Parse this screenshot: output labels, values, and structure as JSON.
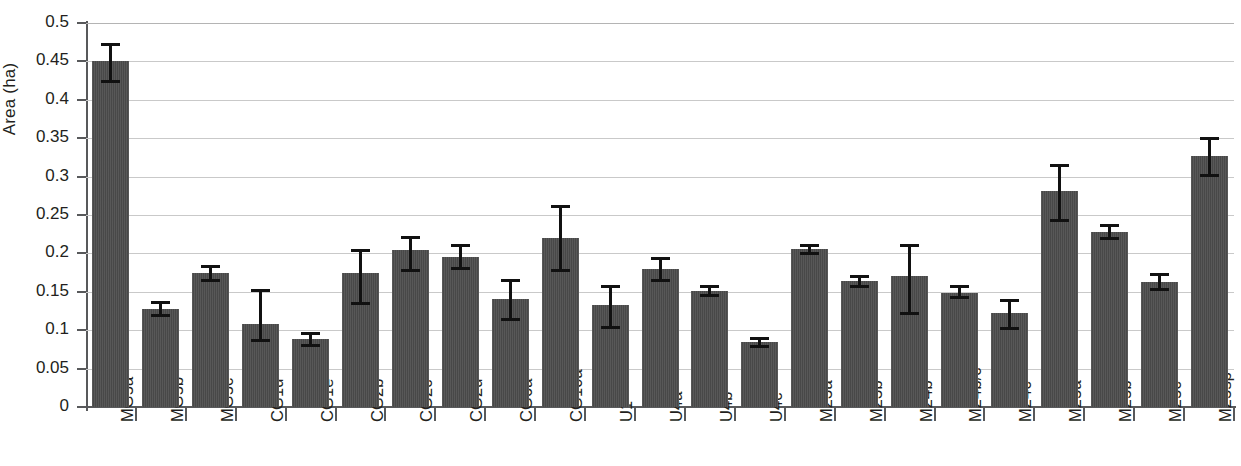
{
  "chart_data": {
    "type": "bar",
    "title": "",
    "xlabel": "",
    "ylabel": "Area (ha)",
    "ylim": [
      0,
      0.5
    ],
    "ytick_labels": [
      "0.5",
      "0.45",
      "0.4",
      "0.35",
      "0.3",
      "0.25",
      "0.2",
      "0.15",
      "0.1",
      "0.05",
      "0"
    ],
    "ytick_values": [
      0.5,
      0.45,
      0.4,
      0.35,
      0.3,
      0.25,
      0.2,
      0.15,
      0.1,
      0.05,
      0
    ],
    "grid": true,
    "legend": null,
    "bar_color": "#4c4c4c",
    "error_bar_color": "#111111",
    "categories": [
      "MG5a",
      "MG5b",
      "MG5c",
      "CG1d",
      "CG1e",
      "CG2b",
      "CG2c",
      "CG2d",
      "CG6a",
      "CG10a",
      "U1",
      "U4a",
      "U4b",
      "U4c",
      "M23a",
      "M23b",
      "M24b",
      "M24b/c",
      "M24c",
      "M25a",
      "M25b",
      "M25c",
      "M25sp"
    ],
    "values": [
      0.45,
      0.128,
      0.174,
      0.108,
      0.088,
      0.174,
      0.204,
      0.195,
      0.14,
      0.22,
      0.133,
      0.18,
      0.151,
      0.084,
      0.206,
      0.164,
      0.171,
      0.149,
      0.123,
      0.281,
      0.228,
      0.163,
      0.327
    ],
    "error_low": [
      0.424,
      0.12,
      0.165,
      0.087,
      0.081,
      0.136,
      0.178,
      0.181,
      0.115,
      0.178,
      0.104,
      0.166,
      0.146,
      0.079,
      0.2,
      0.157,
      0.122,
      0.143,
      0.103,
      0.243,
      0.22,
      0.154,
      0.302
    ],
    "error_high": [
      0.473,
      0.137,
      0.183,
      0.152,
      0.096,
      0.205,
      0.221,
      0.211,
      0.166,
      0.262,
      0.158,
      0.194,
      0.157,
      0.09,
      0.211,
      0.171,
      0.211,
      0.157,
      0.139,
      0.315,
      0.237,
      0.173,
      0.35
    ]
  }
}
